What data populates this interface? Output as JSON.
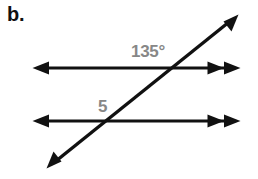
{
  "figure": {
    "part_label": "b.",
    "colors": {
      "line": "#111111",
      "label_text": "#111111",
      "angle_text": "#878787",
      "background": "#ffffff"
    },
    "labels": {
      "angle_top": "135°",
      "angle_bottom": "5"
    },
    "geometry": {
      "canvas": {
        "width": 258,
        "height": 179
      },
      "parallel_lines": [
        {
          "name": "top-parallel-line",
          "y": 68,
          "x_start": 33,
          "x_end": 240,
          "left_arrowheads": 1,
          "right_arrowheads": 2
        },
        {
          "name": "bottom-parallel-line",
          "y": 121,
          "x_start": 33,
          "x_end": 240,
          "left_arrowheads": 1,
          "right_arrowheads": 2
        }
      ],
      "transversal": {
        "name": "transversal-line",
        "x1": 48,
        "y1": 168,
        "x2": 237,
        "y2": 15,
        "start_arrowheads": 1,
        "end_arrowheads": 1
      },
      "intersections": [
        {
          "name": "top-intersection",
          "x": 163,
          "y": 68
        },
        {
          "name": "bottom-intersection",
          "x": 113,
          "y": 121
        }
      ]
    }
  }
}
